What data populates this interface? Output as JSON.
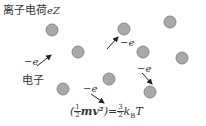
{
  "diagram": {
    "title": "离子电荷",
    "title_symbol": "eZ",
    "electron_label": "电子",
    "electron_charge": "−e",
    "formula": {
      "lhs_open": "(",
      "lhs_frac_num": "1",
      "lhs_frac_den": "2",
      "lhs_body": "mv²",
      "lhs_close": ")",
      "equals": "=",
      "rhs_frac_num": "3",
      "rhs_frac_den": "2",
      "rhs_body": "k",
      "rhs_sub": "B",
      "rhs_T": "T"
    },
    "ions": [
      {
        "cx": 52,
        "cy": 30
      },
      {
        "cx": 78,
        "cy": 52
      },
      {
        "cx": 124,
        "cy": 29
      },
      {
        "cx": 170,
        "cy": 22
      },
      {
        "cx": 143,
        "cy": 52
      },
      {
        "cx": 182,
        "cy": 58
      },
      {
        "cx": 63,
        "cy": 89
      },
      {
        "cx": 109,
        "cy": 79
      },
      {
        "cx": 150,
        "cy": 92
      }
    ],
    "colors": {
      "ion_fill": "#a8a8a8",
      "ion_stroke": "#777777",
      "arrow": "#222222"
    }
  }
}
